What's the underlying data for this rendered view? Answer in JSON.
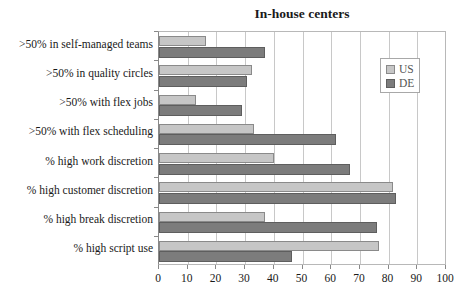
{
  "chart_data": {
    "type": "bar",
    "orientation": "horizontal",
    "title": "In-house centers",
    "xlabel": "",
    "ylabel": "",
    "xlim": [
      0,
      100
    ],
    "xticks": [
      0,
      10,
      20,
      30,
      40,
      50,
      60,
      70,
      80,
      90,
      100
    ],
    "grid": true,
    "legend_position": "upper right (inside)",
    "categories": [
      ">50% in self-managed teams",
      ">50% in quality circles",
      ">50% with flex jobs",
      ">50% with flex scheduling",
      "% high work discretion",
      "% high customer discretion",
      "% high break discretion",
      "% high script use"
    ],
    "series": [
      {
        "name": "US",
        "color": "#c6c6c6",
        "values": [
          16.5,
          32.5,
          13,
          33,
          40,
          81.5,
          37,
          76.5
        ]
      },
      {
        "name": "DE",
        "color": "#7c7c7c",
        "values": [
          37,
          30.5,
          29,
          61.5,
          66.5,
          82.5,
          76,
          46.5
        ]
      }
    ]
  }
}
